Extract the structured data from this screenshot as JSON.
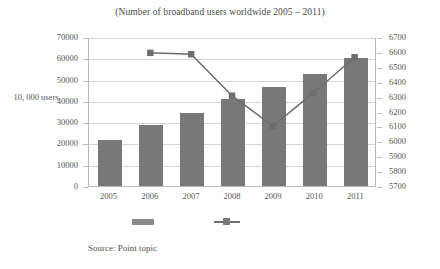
{
  "chart_data": {
    "type": "bar",
    "title": "(Number of broadband users worldwide 2005 – 2011)",
    "xlabel": "",
    "ylabel": "10, 000 users",
    "categories": [
      "2005",
      "2006",
      "2007",
      "2008",
      "2009",
      "2010",
      "2011"
    ],
    "grid": true,
    "legend_position": "bottom",
    "primary_axis": {
      "ylabel": "10, 000 users",
      "ylim": [
        0,
        70000
      ],
      "ticks": [
        0,
        10000,
        20000,
        30000,
        40000,
        50000,
        60000,
        70000
      ],
      "tick_labels": [
        "0",
        "10000",
        "20000",
        "30000",
        "40000",
        "50000",
        "60000",
        "70000"
      ]
    },
    "secondary_axis": {
      "ylim": [
        5700,
        6700
      ],
      "ticks": [
        5700,
        5800,
        5900,
        6000,
        6100,
        6200,
        6300,
        6400,
        6500,
        6600,
        6700
      ],
      "tick_labels": [
        "5700",
        "5800",
        "5900",
        "6000",
        "6100",
        "6200",
        "6300",
        "6400",
        "6500",
        "6600",
        "6700"
      ]
    },
    "series": [
      {
        "name": "broadband-users-bars",
        "type": "bar",
        "axis": "primary",
        "color": "#787878",
        "values": [
          21500,
          28500,
          34500,
          41000,
          46500,
          52500,
          60000
        ]
      },
      {
        "name": "broadband-users-line",
        "type": "line",
        "axis": "secondary",
        "color": "#6e6e6e",
        "values": [
          null,
          6600,
          6590,
          6310,
          6105,
          6330,
          6570
        ]
      }
    ]
  },
  "legend": {
    "entries": [
      {
        "marker": "bar-swatch",
        "label": ""
      },
      {
        "marker": "line-marker-swatch",
        "label": ""
      }
    ]
  },
  "source": {
    "note": "Source: Point topic"
  }
}
